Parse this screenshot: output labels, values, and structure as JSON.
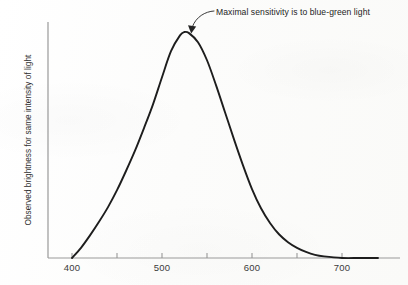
{
  "chart_data": {
    "type": "line",
    "title": "",
    "subtitle": "",
    "xlabel": "",
    "ylabel": "Observed brightness for same intensity of light",
    "xlim": [
      385,
      745
    ],
    "ylim": [
      0,
      1
    ],
    "grid": false,
    "legend": null,
    "x_unit": "nm",
    "axis_ticks": {
      "major_values": [
        400,
        500,
        600,
        700
      ],
      "major_labels": [
        "400",
        "500",
        "600",
        "700"
      ],
      "minor_values": [
        450,
        550,
        650
      ],
      "all_tick_values": [
        400,
        450,
        500,
        550,
        600,
        650,
        700
      ]
    },
    "y_axis_ticks": [],
    "series": [
      {
        "name": "Observed brightness",
        "x": [
          400,
          410,
          420,
          430,
          440,
          450,
          460,
          470,
          480,
          490,
          500,
          510,
          520,
          525,
          530,
          540,
          550,
          560,
          570,
          580,
          590,
          600,
          610,
          620,
          630,
          640,
          650,
          660,
          670,
          680,
          700,
          720,
          740
        ],
        "values": [
          0.0,
          0.045,
          0.1,
          0.16,
          0.225,
          0.3,
          0.385,
          0.475,
          0.575,
          0.68,
          0.8,
          0.915,
          0.985,
          1.0,
          0.995,
          0.955,
          0.875,
          0.765,
          0.645,
          0.525,
          0.41,
          0.305,
          0.22,
          0.155,
          0.105,
          0.07,
          0.045,
          0.027,
          0.014,
          0.007,
          0.0,
          0.0,
          0.0
        ]
      }
    ],
    "peak": {
      "x": 525,
      "y": 1.0,
      "note": "Maximal sensitivity is to blue-green light"
    },
    "annotations": [
      {
        "name": "peak-callout",
        "text": "Maximal sensitivity is to blue-green light",
        "points_to_x": 525,
        "points_to_y": 1.0
      }
    ]
  },
  "axis": {
    "y_title": "Observed brightness for same intensity of light",
    "tick_labels": [
      "400",
      "500",
      "600",
      "700"
    ]
  },
  "annotation": {
    "label": "Maximal sensitivity is to blue-green light"
  },
  "colors": {
    "curve": "#1d1d1d",
    "axis": "#8a8a8a",
    "text": "#262626",
    "background": "#fdfdfc"
  }
}
